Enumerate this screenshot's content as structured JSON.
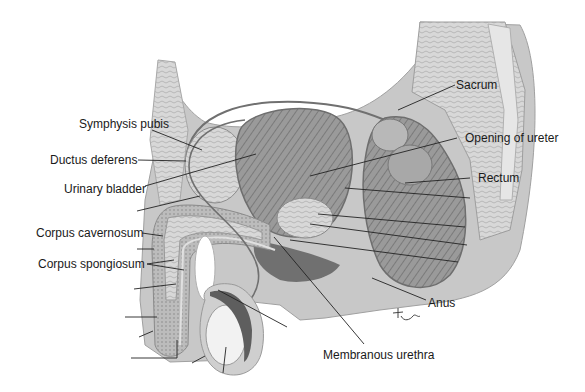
{
  "diagram": {
    "labels": {
      "symphysis_pubis": "Symphysis pubis",
      "ductus_deferens": "Ductus deferens",
      "urinary_bladder": "Urinary bladder",
      "corpus_cavernosum": "Corpus cavernosum",
      "corpus_spongiosum": "Corpus spongiosum",
      "sacrum": "Sacrum",
      "opening_of_ureter": "Opening of ureter",
      "rectum": "Rectum",
      "anus": "Anus",
      "membranous_urethra": "Membranous urethra"
    },
    "unlabeled_leader_lines": 12,
    "signature": "Tina"
  }
}
